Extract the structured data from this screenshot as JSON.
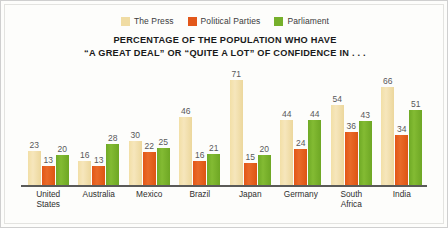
{
  "chart_data": {
    "type": "bar",
    "title_lines": [
      "PERCENTAGE OF THE POPULATION WHO HAVE",
      "“A GREAT DEAL” OR “QUITE A LOT” OF CONFIDENCE IN . . ."
    ],
    "xlabel": "",
    "ylabel": "",
    "ylim": [
      0,
      75
    ],
    "grid": false,
    "legend_position": "top-center",
    "categories": [
      "United States",
      "Australia",
      "Mexico",
      "Brazil",
      "Japan",
      "Germany",
      "South Africa",
      "India"
    ],
    "category_lines": [
      [
        "United",
        "States"
      ],
      [
        "Australia"
      ],
      [
        "Mexico"
      ],
      [
        "Brazil"
      ],
      [
        "Japan"
      ],
      [
        "Germany"
      ],
      [
        "South",
        "Africa"
      ],
      [
        "India"
      ]
    ],
    "series": [
      {
        "name": "The Press",
        "color": "#f0dca3",
        "values": [
          23,
          16,
          30,
          46,
          71,
          44,
          54,
          66
        ]
      },
      {
        "name": "Political Parties",
        "color": "#e2571a",
        "values": [
          13,
          13,
          22,
          16,
          15,
          24,
          36,
          34
        ]
      },
      {
        "name": "Parliament",
        "color": "#76b02b",
        "values": [
          20,
          28,
          25,
          21,
          20,
          44,
          43,
          51
        ]
      }
    ]
  },
  "legend": {
    "items": [
      {
        "label": "The Press",
        "color": "#f0dca3"
      },
      {
        "label": "Political Parties",
        "color": "#e2571a"
      },
      {
        "label": "Parliament",
        "color": "#76b02b"
      }
    ]
  },
  "colors": {
    "press": "#f0dca3",
    "political_parties": "#e2571a",
    "parliament": "#76b02b",
    "title_text": "#1a1a1a",
    "value_text": "#58585a",
    "axis": "#5a5a58",
    "background": "#fdfdfb",
    "frame": "#cfcfcf"
  }
}
